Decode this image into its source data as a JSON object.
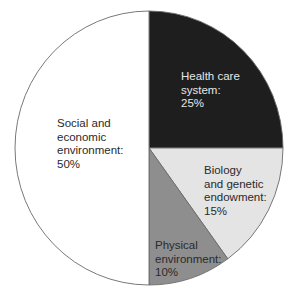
{
  "chart_data": {
    "type": "pie",
    "title": "",
    "start_angle_deg": -90,
    "direction": "clockwise",
    "slices": [
      {
        "label": "Health care system",
        "display": "Health care\nsystem:\n25%",
        "value": 25,
        "color": "#1e1e1e",
        "text_color": "#e6e6e6"
      },
      {
        "label": "Biology and genetic endowment",
        "display": "Biology\nand genetic\nendowment:\n15%",
        "value": 15,
        "color": "#e4e4e4",
        "text_color": "#2a2a2a"
      },
      {
        "label": "Physical environment",
        "display": "Physical\nenvironment:\n10%",
        "value": 10,
        "color": "#8e8e8e",
        "text_color": "#2a2a2a"
      },
      {
        "label": "Social and economic environment",
        "display": "Social and\neconomic\nenvironment:\n50%",
        "value": 50,
        "color": "#ffffff",
        "text_color": "#2a2a2a"
      }
    ],
    "categories": [
      "Health care system",
      "Biology and genetic endowment",
      "Physical environment",
      "Social and economic environment"
    ],
    "values": [
      25,
      15,
      10,
      50
    ],
    "unit": "%",
    "legend": "none (labels inside slices)",
    "outline_color": "#6a6a6a"
  }
}
